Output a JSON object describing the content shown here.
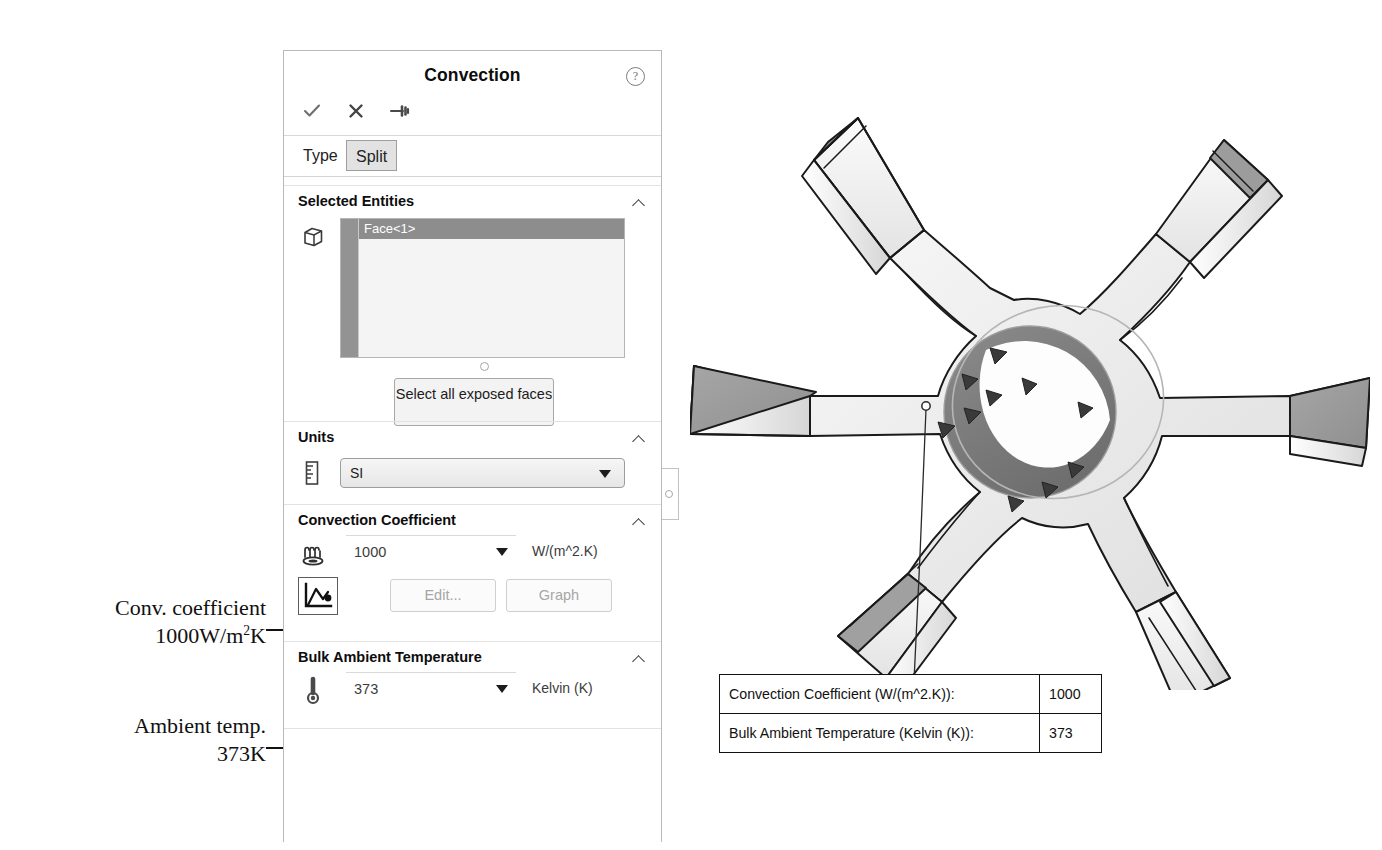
{
  "panel": {
    "title": "Convection",
    "help_icon": "help-circle-icon",
    "toolbar": [
      {
        "name": "ok-check-icon",
        "label": "OK"
      },
      {
        "name": "cancel-x-icon",
        "label": "Cancel"
      },
      {
        "name": "pushpin-icon",
        "label": "Keep Visible"
      }
    ],
    "tabs": [
      {
        "label": "Type",
        "active": true
      },
      {
        "label": "Split",
        "active": false
      }
    ],
    "sections": {
      "selected_entities": {
        "title": "Selected Entities",
        "collapse_state": "expanded",
        "entity_icon": "face-cube-icon",
        "items": [
          "Face<1>"
        ],
        "select_all_button": "Select all exposed faces"
      },
      "units": {
        "title": "Units",
        "collapse_state": "expanded",
        "icon": "ruler-units-icon",
        "value": "SI",
        "options": [
          "SI",
          "English (IPS)",
          "Metric (G)"
        ]
      },
      "convection_coefficient": {
        "title": "Convection Coefficient",
        "collapse_state": "expanded",
        "icon": "convection-heat-icon",
        "value": "1000",
        "unit": "W/(m^2.K)",
        "graph_icon": "curve-graph-icon",
        "edit_button": "Edit...",
        "graph_button": "Graph",
        "buttons_disabled": true
      },
      "bulk_ambient_temperature": {
        "title": "Bulk Ambient Temperature",
        "collapse_state": "expanded",
        "icon": "thermometer-icon",
        "value": "373",
        "unit": "Kelvin (K)"
      }
    }
  },
  "annotations": [
    {
      "line1": "Conv. coefficient",
      "line2_pre": "1000W/m",
      "line2_sup": "2",
      "line2_post": "K"
    },
    {
      "line1": "Ambient temp.",
      "line2_pre": "373K",
      "line2_sup": "",
      "line2_post": ""
    }
  ],
  "callout": {
    "rows": [
      {
        "label": "Convection Coefficient (W/(m^2.K)):",
        "value": "1000"
      },
      {
        "label": "Bulk Ambient Temperature (Kelvin (K)):",
        "value": "373"
      }
    ]
  },
  "model": {
    "name": "six-blade-impeller-fan",
    "selected_face": "inner-bore-cylindrical-face",
    "convection_marker_count": 9,
    "blade_count": 6
  },
  "colors": {
    "selected_face": "#7d7d7d",
    "blade_top": "#9b9b9b",
    "body_light": "#efefef",
    "outline": "#1a1a1a",
    "panel_border": "#b9b9b9",
    "list_selection": "#8d8d8d",
    "disabled_text": "#a6a6a6"
  }
}
